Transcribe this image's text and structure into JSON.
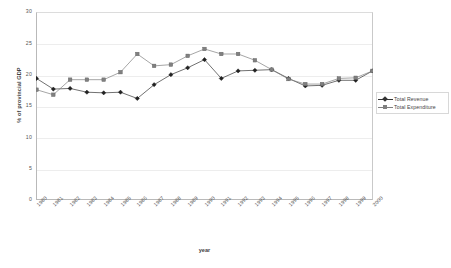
{
  "chart_data": {
    "type": "line",
    "title": "",
    "xlabel": "year",
    "ylabel": "% of provincial GDP",
    "ylim": [
      0,
      30
    ],
    "yticks": [
      0,
      5,
      10,
      15,
      20,
      25,
      30
    ],
    "grid": true,
    "legend_position": "right",
    "categories": [
      "1980",
      "1981",
      "1982",
      "1983",
      "1984",
      "1985",
      "1986",
      "1987",
      "1988",
      "1989",
      "1990",
      "1991",
      "1992",
      "1993",
      "1994",
      "1995",
      "1996",
      "1997",
      "1998",
      "1999",
      "2000"
    ],
    "series": [
      {
        "name": "Total Revenue",
        "color": "#333333",
        "marker": "diamond",
        "values": [
          19.4,
          17.7,
          17.8,
          17.2,
          17.1,
          17.2,
          16.2,
          18.4,
          20.0,
          21.1,
          22.4,
          19.4,
          20.6,
          20.7,
          20.8,
          19.4,
          18.2,
          18.3,
          19.1,
          19.1,
          20.6
        ]
      },
      {
        "name": "Total Expenditure",
        "color": "#808080",
        "marker": "square",
        "values": [
          17.6,
          16.8,
          19.2,
          19.2,
          19.2,
          20.4,
          23.3,
          21.4,
          21.6,
          23.0,
          24.1,
          23.3,
          23.3,
          22.3,
          20.8,
          19.3,
          18.5,
          18.5,
          19.4,
          19.5,
          20.6
        ]
      }
    ]
  },
  "legend": {
    "items": [
      {
        "label": "Total Revenue"
      },
      {
        "label": "Total Expenditure"
      }
    ]
  }
}
